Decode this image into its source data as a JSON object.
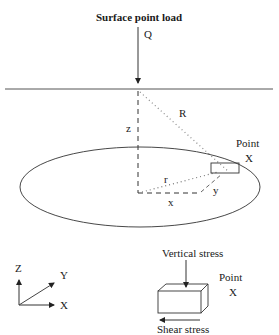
{
  "diagram": {
    "title": "Surface point load",
    "load_label": "Q",
    "depth_label": "z",
    "distance_label": "R",
    "radial_label": "r",
    "x_offset_label": "x",
    "y_offset_label": "y",
    "point_label_line1": "Point",
    "point_label_line2": "X",
    "axes": {
      "z": "Z",
      "y": "Y",
      "x": "X"
    },
    "element": {
      "vertical_stress_label": "Vertical stress",
      "shear_stress_label": "Shear stress",
      "point_label_line1": "Point",
      "point_label_line2": "X"
    },
    "colors": {
      "line": "#222222",
      "dotted": "#888888",
      "background": "#ffffff"
    }
  }
}
